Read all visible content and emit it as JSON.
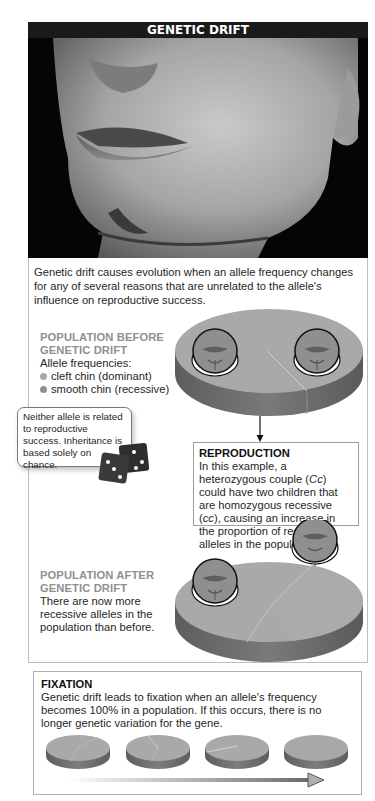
{
  "header": {
    "title": "GENETIC DRIFT"
  },
  "photo": {
    "subject": "close-up photo of a man's chin with a cleft"
  },
  "intro": {
    "text": "Genetic drift causes evolution when an allele frequency changes for any of several reasons that are unrelated to the allele's influence on reproductive success."
  },
  "before": {
    "heading_line1": "POPULATION BEFORE",
    "heading_line2": "GENETIC DRIFT",
    "subheading": "Allele frequencies:",
    "legend": [
      {
        "label": "cleft chin (dominant)",
        "color": "#a8a8a8"
      },
      {
        "label": "smooth chin (recessive)",
        "color": "#8e8e8e"
      }
    ]
  },
  "callout": {
    "text": "Neither allele is related to reproductive success. Inheritance is based solely on chance.",
    "icon": "dice-icon"
  },
  "reproduction": {
    "title": "REPRODUCTION",
    "text_part1": "In this example, a heterozygous couple (",
    "genotype_het": "Cc",
    "text_part2": ") could have two children that are homozygous recessive (",
    "genotype_rec": "cc",
    "text_part3": "), causing an increase in the proportion of recessive alleles in the population."
  },
  "after": {
    "heading_line1": "POPULATION AFTER",
    "heading_line2": "GENETIC DRIFT",
    "text": "There are now more recessive alleles in the population than before."
  },
  "fixation": {
    "title": "FIXATION",
    "text": "Genetic drift leads to fixation when an allele's frequency becomes 100% in a population. If this occurs, there is no longer genetic variation for the gene.",
    "pies": [
      {
        "stage": 1,
        "description": "mixed alleles"
      },
      {
        "stage": 2,
        "description": "fewer of one allele"
      },
      {
        "stage": 3,
        "description": "small remaining slice"
      },
      {
        "stage": 4,
        "description": "fixed, one allele at 100%"
      }
    ]
  },
  "colors": {
    "title_bar": "#1a1a1a",
    "heading_gray": "#8f8f8f",
    "pie_top": "#a9a9a9",
    "pie_side": "#6a6a6a"
  }
}
